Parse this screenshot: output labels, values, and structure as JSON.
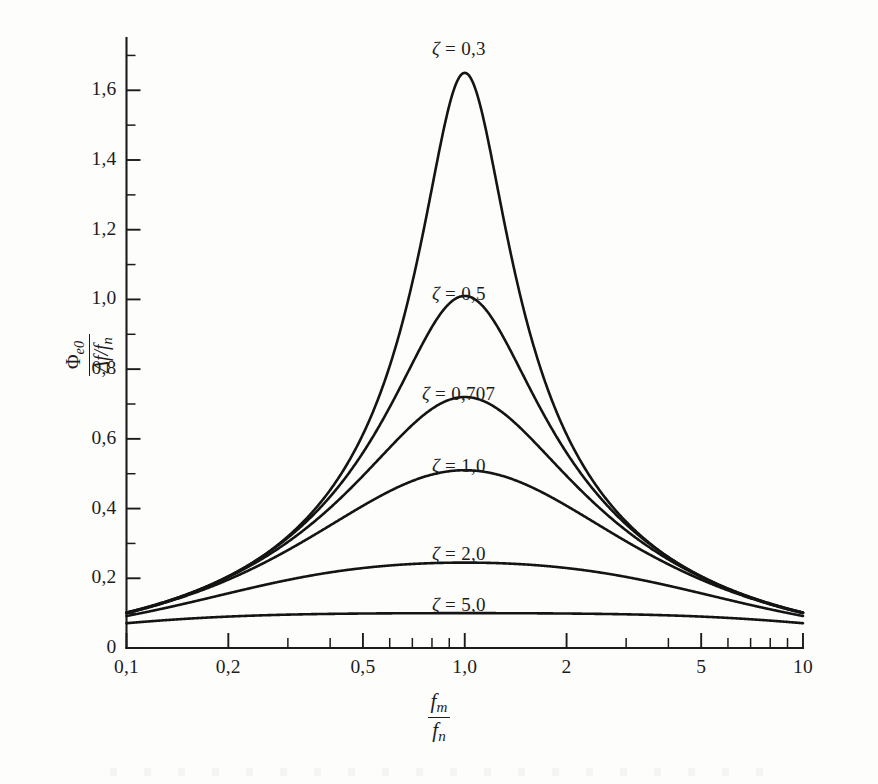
{
  "figure": {
    "background_color": "#fdfdfc",
    "ink_color": "#141414"
  },
  "axes": {
    "x": {
      "scale": "log",
      "title_numerator": "f",
      "title_numerator_sub": "m",
      "title_denominator": "f",
      "title_denominator_sub": "n",
      "range": [
        0.1,
        10
      ],
      "tick_labels": [
        "0,1",
        "0,2",
        "0,5",
        "1,0",
        "2",
        "5",
        "10"
      ],
      "tick_values": [
        0.1,
        0.2,
        0.5,
        1.0,
        2.0,
        5.0,
        10.0
      ]
    },
    "y": {
      "scale": "linear",
      "title_numerator": "Φ",
      "title_numerator_sub": "e0",
      "title_denominator": "Δf/f",
      "title_denominator_sub": "n",
      "range": [
        0,
        1.75
      ],
      "tick_labels": [
        "0",
        "0,2",
        "0,4",
        "0,6",
        "0,8",
        "1,0",
        "1,2",
        "1,4",
        "1,6"
      ],
      "tick_values": [
        0,
        0.2,
        0.4,
        0.6,
        0.8,
        1.0,
        1.2,
        1.4,
        1.6
      ],
      "minor_step": 0.1
    }
  },
  "curve_labels": [
    {
      "symbol": "ζ",
      "equals": "=",
      "value": "0,3",
      "x_px": 432,
      "y_px": 38
    },
    {
      "symbol": "ζ",
      "equals": "=",
      "value": "0,5",
      "x_px": 432,
      "y_px": 283
    },
    {
      "symbol": "ζ",
      "equals": "=",
      "value": "0,707",
      "x_px": 422,
      "y_px": 383
    },
    {
      "symbol": "ζ",
      "equals": "=",
      "value": "1,0",
      "x_px": 432,
      "y_px": 455
    },
    {
      "symbol": "ζ",
      "equals": "=",
      "value": "2,0",
      "x_px": 432,
      "y_px": 543
    },
    {
      "symbol": "ζ",
      "equals": "=",
      "value": "5,0",
      "x_px": 432,
      "y_px": 594
    }
  ],
  "chart_data": {
    "type": "line",
    "title": "",
    "xlabel": "f_m / f_n",
    "ylabel": "Φ_e0 / (Δf/f_n)",
    "xscale": "log",
    "xlim": [
      0.1,
      10
    ],
    "ylim": [
      0,
      1.75
    ],
    "grid": false,
    "legend": "inline curve annotations",
    "x": [
      0.1,
      0.125,
      0.16,
      0.2,
      0.25,
      0.32,
      0.4,
      0.5,
      0.63,
      0.8,
      0.9,
      1.0,
      1.12,
      1.25,
      1.6,
      2.0,
      2.5,
      3.2,
      4.0,
      5.0,
      6.3,
      8.0,
      10.0
    ],
    "series": [
      {
        "name": "ζ = 0,3",
        "zeta": 0.3,
        "peak_value": 1.65,
        "peak_x": 1.0,
        "values": [
          0.1,
          0.126,
          0.162,
          0.205,
          0.261,
          0.348,
          0.455,
          0.601,
          0.83,
          1.233,
          1.49,
          1.65,
          1.43,
          1.075,
          0.56,
          0.345,
          0.223,
          0.145,
          0.105,
          0.078,
          0.058,
          0.042,
          0.032
        ]
      },
      {
        "name": "ζ = 0,5",
        "zeta": 0.5,
        "peak_value": 1.01,
        "peak_x": 1.0,
        "values": [
          0.1,
          0.125,
          0.161,
          0.203,
          0.256,
          0.336,
          0.43,
          0.55,
          0.718,
          0.93,
          0.985,
          1.01,
          0.96,
          0.86,
          0.565,
          0.384,
          0.26,
          0.172,
          0.127,
          0.095,
          0.071,
          0.052,
          0.04
        ]
      },
      {
        "name": "ζ = 0,707",
        "zeta": 0.707,
        "peak_value": 0.72,
        "peak_x": 1.0,
        "values": [
          0.099,
          0.124,
          0.159,
          0.199,
          0.249,
          0.321,
          0.401,
          0.496,
          0.608,
          0.7,
          0.715,
          0.72,
          0.705,
          0.668,
          0.508,
          0.376,
          0.267,
          0.182,
          0.137,
          0.103,
          0.078,
          0.058,
          0.044
        ]
      },
      {
        "name": "ζ = 1,0",
        "zeta": 1.0,
        "peak_value": 0.51,
        "peak_x": 1.0,
        "values": [
          0.098,
          0.122,
          0.156,
          0.193,
          0.238,
          0.3,
          0.364,
          0.432,
          0.49,
          0.508,
          0.51,
          0.508,
          0.497,
          0.478,
          0.399,
          0.315,
          0.234,
          0.165,
          0.126,
          0.096,
          0.073,
          0.054,
          0.042
        ]
      },
      {
        "name": "ζ = 2,0",
        "zeta": 2.0,
        "peak_value": 0.245,
        "peak_x": 1.0,
        "values": [
          0.092,
          0.113,
          0.14,
          0.167,
          0.195,
          0.222,
          0.236,
          0.244,
          0.246,
          0.245,
          0.245,
          0.244,
          0.241,
          0.236,
          0.212,
          0.183,
          0.15,
          0.115,
          0.092,
          0.073,
          0.057,
          0.044,
          0.035
        ]
      },
      {
        "name": "ζ = 5,0",
        "zeta": 5.0,
        "peak_value": 0.1,
        "peak_x": 1.0,
        "values": [
          0.055,
          0.065,
          0.076,
          0.085,
          0.092,
          0.097,
          0.099,
          0.1,
          0.1,
          0.1,
          0.1,
          0.1,
          0.099,
          0.098,
          0.094,
          0.088,
          0.079,
          0.067,
          0.057,
          0.047,
          0.038,
          0.03,
          0.024
        ]
      }
    ]
  }
}
